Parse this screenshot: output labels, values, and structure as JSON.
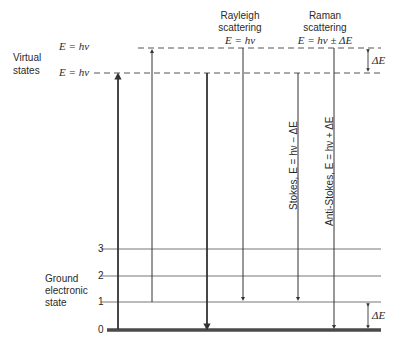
{
  "figure": {
    "type": "energy-level diagram"
  },
  "left_labels": {
    "virtual_states": [
      "Virtual",
      "states"
    ],
    "upper_virtual_energy": "E = hν",
    "lower_virtual_energy": "E = hν",
    "ground_state": [
      "Ground",
      "electronic",
      "state"
    ]
  },
  "levels": {
    "vibrational": [
      "3",
      "2",
      "1",
      "0"
    ]
  },
  "headers": {
    "rayleigh": {
      "line1": "Rayleigh",
      "line2": "scattering",
      "formula": "E = hν"
    },
    "raman": {
      "line1": "Raman",
      "line2": "scattering",
      "formula": "E = hν ± ΔE"
    }
  },
  "transitions": {
    "stokes": "Stokes, E = hν − ΔE",
    "anti_stokes": "Anti-Stokes, E = hν + ΔE"
  },
  "delta_labels": {
    "top": "ΔE",
    "bottom": "ΔE"
  },
  "colors": {
    "line": "#3a3a3a",
    "dash": "#555555",
    "ground": "#4a4a4a"
  }
}
